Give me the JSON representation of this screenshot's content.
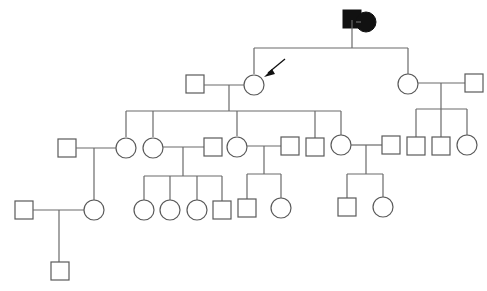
{
  "diagram": {
    "type": "pedigree",
    "title": "",
    "colors": {
      "line": "#6a6a6a",
      "affected": "#111111",
      "unaffected": "#ffffff"
    },
    "legend": [],
    "generations": [
      {
        "level": "I",
        "individuals": [
          {
            "id": "I-1",
            "sex": "male",
            "affected": true
          },
          {
            "id": "I-2",
            "sex": "female",
            "affected": true
          }
        ]
      },
      {
        "level": "II",
        "individuals": [
          {
            "id": "II-1",
            "sex": "male",
            "affected": false,
            "spouse_of": "II-2"
          },
          {
            "id": "II-2",
            "sex": "female",
            "affected": false,
            "proband": true
          },
          {
            "id": "II-3",
            "sex": "female",
            "affected": false
          },
          {
            "id": "II-4",
            "sex": "male",
            "affected": false,
            "spouse_of": "II-3"
          }
        ]
      },
      {
        "level": "III",
        "individuals": [
          {
            "id": "III-1",
            "sex": "male",
            "affected": false
          },
          {
            "id": "III-2",
            "sex": "female",
            "affected": false
          },
          {
            "id": "III-3",
            "sex": "female",
            "affected": false
          },
          {
            "id": "III-4",
            "sex": "male",
            "affected": false
          },
          {
            "id": "III-5",
            "sex": "female",
            "affected": false
          },
          {
            "id": "III-6",
            "sex": "male",
            "affected": false
          },
          {
            "id": "III-7",
            "sex": "male",
            "affected": false
          },
          {
            "id": "III-8",
            "sex": "female",
            "affected": false
          },
          {
            "id": "III-9",
            "sex": "male",
            "affected": false
          },
          {
            "id": "III-10",
            "sex": "male",
            "affected": false
          },
          {
            "id": "III-11",
            "sex": "male",
            "affected": false
          },
          {
            "id": "III-12",
            "sex": "female",
            "affected": false
          }
        ]
      },
      {
        "level": "IV",
        "individuals": [
          {
            "id": "IV-1",
            "sex": "male",
            "affected": false
          },
          {
            "id": "IV-2",
            "sex": "female",
            "affected": false
          },
          {
            "id": "IV-3",
            "sex": "female",
            "affected": false
          },
          {
            "id": "IV-4",
            "sex": "female",
            "affected": false
          },
          {
            "id": "IV-5",
            "sex": "female",
            "affected": false
          },
          {
            "id": "IV-6",
            "sex": "male",
            "affected": false
          },
          {
            "id": "IV-7",
            "sex": "male",
            "affected": false
          },
          {
            "id": "IV-8",
            "sex": "female",
            "affected": false
          },
          {
            "id": "IV-9",
            "sex": "male",
            "affected": false
          },
          {
            "id": "IV-10",
            "sex": "female",
            "affected": false
          }
        ]
      },
      {
        "level": "V",
        "individuals": [
          {
            "id": "V-1",
            "sex": "male",
            "affected": false
          }
        ]
      }
    ],
    "proband_marker": "arrow"
  }
}
